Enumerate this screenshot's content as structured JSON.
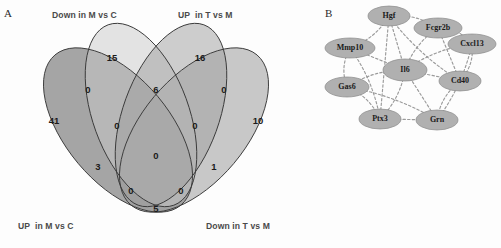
{
  "figure": {
    "panel_a_letter": "A",
    "panel_b_letter": "B"
  },
  "panel_a": {
    "type": "venn-diagram-4set",
    "set_labels": {
      "top_left": "Down in M vs C",
      "top_right": "UP  in T vs M",
      "bottom_left": "UP  in M vs C",
      "bottom_right": "Down in T vs M"
    },
    "sets": [
      {
        "id": "set-up-m-vs-c",
        "label": "UP  in M vs C",
        "fill": "#8f8f8f"
      },
      {
        "id": "set-down-m-vs-c",
        "label": "Down in M vs C",
        "fill": "#f2f2f2"
      },
      {
        "id": "set-up-t-vs-m",
        "label": "UP  in T vs M",
        "fill": "#9a9a9a"
      },
      {
        "id": "set-down-t-vs-m",
        "label": "Down in T vs M",
        "fill": "#b6b6b6"
      }
    ],
    "regions": [
      {
        "id": "region-down-m-only",
        "value": "15",
        "x": 112,
        "y": 57
      },
      {
        "id": "region-up-t-only",
        "value": "16",
        "x": 200,
        "y": 57
      },
      {
        "id": "region-up-m-only",
        "value": "41",
        "x": 54,
        "y": 120
      },
      {
        "id": "region-down-t-only",
        "value": "10",
        "x": 258,
        "y": 120
      },
      {
        "id": "region-down-m-up-t",
        "value": "6",
        "x": 156,
        "y": 89
      },
      {
        "id": "region-up-m-down-m",
        "value": "0",
        "x": 88,
        "y": 89
      },
      {
        "id": "region-up-t-down-t",
        "value": "0",
        "x": 224,
        "y": 89
      },
      {
        "id": "region-up-m-down-m-up-t",
        "value": "0",
        "x": 117,
        "y": 125
      },
      {
        "id": "region-down-m-up-t-down-t",
        "value": "0",
        "x": 195,
        "y": 125
      },
      {
        "id": "region-up-m-up-t-down-t",
        "value": "1",
        "x": 214,
        "y": 166
      },
      {
        "id": "region-up-m-down-m-down-t",
        "value": "3",
        "x": 98,
        "y": 166
      },
      {
        "id": "region-all-four",
        "value": "0",
        "x": 156,
        "y": 155
      },
      {
        "id": "region-up-m-up-t",
        "value": "0",
        "x": 131,
        "y": 190
      },
      {
        "id": "region-down-m-down-t",
        "value": "0",
        "x": 181,
        "y": 190
      },
      {
        "id": "region-up-m-down-t",
        "value": "5",
        "x": 156,
        "y": 208
      }
    ]
  },
  "panel_b": {
    "type": "network-graph",
    "node_fill": "#b0b0b0",
    "node_stroke": "#8a8a8a",
    "edge_color": "#9b9b9b",
    "edge_style": "dashed",
    "nodes": [
      {
        "id": "node-hgf",
        "label": "Hgf",
        "x": 77,
        "y": 16,
        "rx": 21,
        "ry": 10
      },
      {
        "id": "node-fcgr2b",
        "label": "Fcgr2b",
        "x": 126,
        "y": 28,
        "rx": 24,
        "ry": 10
      },
      {
        "id": "node-cxcl13",
        "label": "Cxcl13",
        "x": 160,
        "y": 44,
        "rx": 24,
        "ry": 10
      },
      {
        "id": "node-mmp10",
        "label": "Mmp10",
        "x": 38,
        "y": 48,
        "rx": 25,
        "ry": 10
      },
      {
        "id": "node-il6",
        "label": "Il6",
        "x": 93,
        "y": 70,
        "rx": 22,
        "ry": 11
      },
      {
        "id": "node-cd40",
        "label": "Cd40",
        "x": 148,
        "y": 81,
        "rx": 21,
        "ry": 10
      },
      {
        "id": "node-gas6",
        "label": "Gas6",
        "x": 35,
        "y": 87,
        "rx": 22,
        "ry": 10
      },
      {
        "id": "node-ptx3",
        "label": "Ptx3",
        "x": 68,
        "y": 119,
        "rx": 21,
        "ry": 10
      },
      {
        "id": "node-grn",
        "label": "Grn",
        "x": 125,
        "y": 120,
        "rx": 21,
        "ry": 10
      }
    ],
    "edges": [
      {
        "from": "node-hgf",
        "to": "node-mmp10"
      },
      {
        "from": "node-hgf",
        "to": "node-il6"
      },
      {
        "from": "node-hgf",
        "to": "node-cd40"
      },
      {
        "from": "node-hgf",
        "to": "node-fcgr2b"
      },
      {
        "from": "node-hgf",
        "to": "node-ptx3"
      },
      {
        "from": "node-fcgr2b",
        "to": "node-il6"
      },
      {
        "from": "node-fcgr2b",
        "to": "node-cxcl13"
      },
      {
        "from": "node-fcgr2b",
        "to": "node-cd40"
      },
      {
        "from": "node-cxcl13",
        "to": "node-il6"
      },
      {
        "from": "node-cxcl13",
        "to": "node-cd40"
      },
      {
        "from": "node-mmp10",
        "to": "node-il6"
      },
      {
        "from": "node-mmp10",
        "to": "node-gas6"
      },
      {
        "from": "node-mmp10",
        "to": "node-ptx3"
      },
      {
        "from": "node-il6",
        "to": "node-cd40"
      },
      {
        "from": "node-il6",
        "to": "node-gas6"
      },
      {
        "from": "node-il6",
        "to": "node-ptx3"
      },
      {
        "from": "node-il6",
        "to": "node-grn"
      },
      {
        "from": "node-cd40",
        "to": "node-grn"
      },
      {
        "from": "node-gas6",
        "to": "node-ptx3"
      },
      {
        "from": "node-ptx3",
        "to": "node-grn"
      },
      {
        "from": "node-grn",
        "to": "node-cxcl13"
      },
      {
        "from": "node-gas6",
        "to": "node-grn"
      }
    ]
  }
}
